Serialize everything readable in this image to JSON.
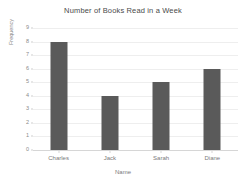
{
  "chart_data": {
    "type": "bar",
    "title": "Number of Books Read in a Week",
    "xlabel": "Name",
    "ylabel": "Frequency",
    "categories": [
      "Charles",
      "Jack",
      "Sarah",
      "Diane"
    ],
    "values": [
      8,
      4,
      5,
      6
    ],
    "ylim": [
      0,
      9
    ],
    "ytick_step": 1,
    "yticks": [
      0,
      1,
      2,
      3,
      4,
      5,
      6,
      7,
      8,
      9
    ],
    "ytick_labels": [
      "0",
      "1",
      "2",
      "3",
      "4",
      "5",
      "6",
      "7",
      "8",
      "9"
    ],
    "grid": true,
    "grid_axis": "y",
    "legend": false,
    "bar_color": "#5a5a5a",
    "background_color": "#ffffff",
    "gridline_color": "#eeeeee",
    "axis_color": "#d6d6d6"
  }
}
